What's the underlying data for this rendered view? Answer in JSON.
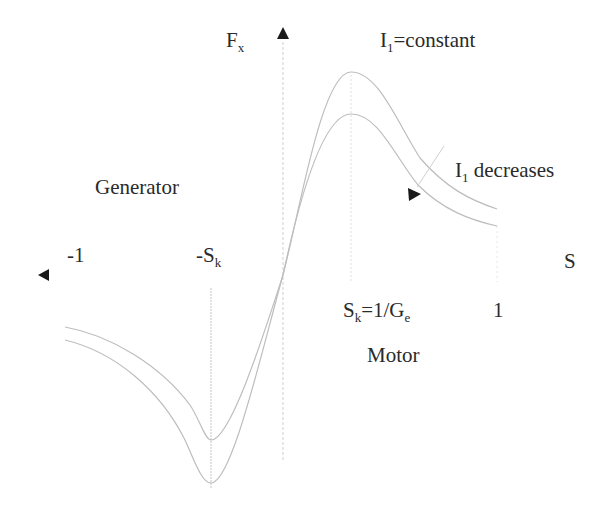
{
  "diagram": {
    "axes": {
      "y_axis_label": "F",
      "y_axis_label_sub": "x",
      "x_axis_label": "S"
    },
    "ticks": {
      "neg_one": "-1",
      "neg_sk": "-S",
      "neg_sk_sub": "k",
      "sk": "S",
      "sk_sub": "k",
      "sk_eq": "=1/G",
      "sk_eq_sub": "e",
      "pos_one": "1"
    },
    "annotations": {
      "constant_main": "I",
      "constant_sub": "1",
      "constant_rest": "=constant",
      "decreases_main": "I",
      "decreases_sub": "1",
      "decreases_rest": " decreases",
      "generator": "Generator",
      "motor": "Motor"
    },
    "series": [
      {
        "name": "I1=constant",
        "peak_positive": "upper curve",
        "color": "#bdbdbd"
      },
      {
        "name": "I1 decreases",
        "peak_positive": "lower curve",
        "color": "#bdbdbd"
      }
    ],
    "colors": {
      "curve": "#bdbdbd",
      "axis": "#c8c8c8",
      "arrow": "#1a1a1a",
      "text": "#2a2a2a"
    }
  }
}
